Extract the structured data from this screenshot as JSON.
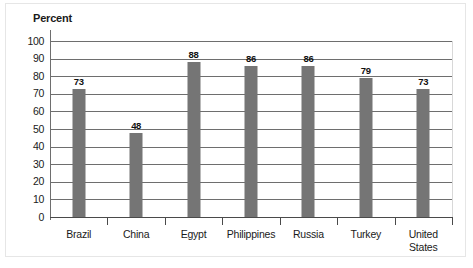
{
  "chart_data": {
    "type": "bar",
    "title": "",
    "ylabel": "Percent",
    "xlabel": "",
    "categories": [
      "Brazil",
      "China",
      "Egypt",
      "Philippines",
      "Russia",
      "Turkey",
      "United States"
    ],
    "values": [
      73,
      48,
      88,
      86,
      86,
      79,
      73
    ],
    "value_labels": [
      "73",
      "48",
      "88",
      "86",
      "86",
      "79",
      "73"
    ],
    "ylim": [
      0,
      100
    ],
    "ytick_step": 10,
    "yticks": [
      "100",
      "90",
      "80",
      "70",
      "60",
      "50",
      "40",
      "30",
      "20",
      "10",
      "0"
    ],
    "ytick_values": [
      100,
      90,
      80,
      70,
      60,
      50,
      40,
      30,
      20,
      10,
      0
    ],
    "grid": true,
    "grid_axis": "y",
    "legend": false,
    "bar_color": "#757575",
    "grid_color": "#6e6e6e",
    "axis_color": "#4a4a4a",
    "text_color": "#1a1a1a"
  }
}
